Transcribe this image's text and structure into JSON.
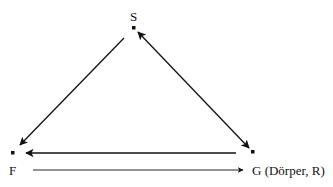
{
  "diagram": {
    "type": "triangle-relations",
    "colors": {
      "line": "#111111",
      "background": "#ffffff"
    },
    "nodes": [
      {
        "id": "S",
        "label": "S",
        "x": 134,
        "y": 28
      },
      {
        "id": "F",
        "label": "F",
        "x": 13,
        "y": 153
      },
      {
        "id": "G",
        "label": "G (Dörper, R)",
        "x": 253,
        "y": 152
      }
    ],
    "edges": [
      {
        "from": "S",
        "to": "F",
        "direction": "one-way"
      },
      {
        "from": "S",
        "to": "G",
        "direction": "two-way"
      },
      {
        "from": "G",
        "to": "F",
        "direction": "one-way",
        "row": "upper"
      },
      {
        "from": "F",
        "to": "G",
        "direction": "one-way",
        "row": "lower"
      }
    ]
  }
}
